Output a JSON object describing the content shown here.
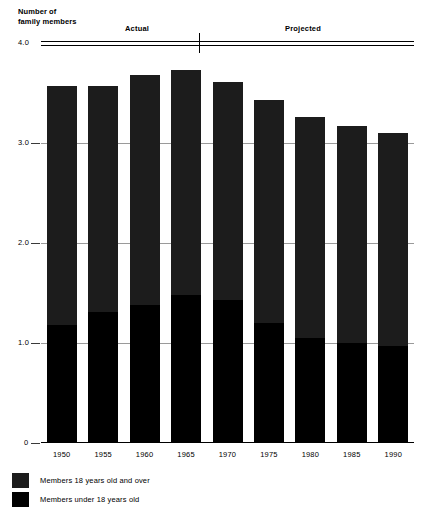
{
  "chart_data": {
    "type": "bar",
    "stacked": true,
    "title": "",
    "ylabel": "Number of\nfamily members",
    "xlabel": "",
    "ylim": [
      0,
      4.0
    ],
    "grid": true,
    "y_ticks": [
      "4.0",
      "3.0",
      "2.0",
      "1.0",
      "0"
    ],
    "y_tick_values": [
      4.0,
      3.0,
      2.0,
      1.0,
      0
    ],
    "categories": [
      "1950",
      "1955",
      "1960",
      "1965",
      "1970",
      "1975",
      "1980",
      "1985",
      "1990"
    ],
    "series": [
      {
        "name": "Members 18 years old and over",
        "values": [
          2.39,
          2.26,
          2.3,
          2.25,
          2.18,
          2.23,
          2.21,
          2.17,
          2.13
        ]
      },
      {
        "name": "Members under 18 years old",
        "values": [
          1.18,
          1.31,
          1.38,
          1.48,
          1.43,
          1.2,
          1.05,
          1.0,
          0.97
        ]
      }
    ],
    "totals": [
      3.57,
      3.57,
      3.68,
      3.73,
      3.61,
      3.43,
      3.26,
      3.17,
      3.1
    ],
    "annotations": [
      {
        "label": "Actual",
        "range": [
          "1950",
          "1970"
        ]
      },
      {
        "label": "Projected",
        "range": [
          "1975",
          "1990"
        ]
      }
    ],
    "colors": {
      "members_over_18": "#1c1c1c",
      "members_under_18": "#000000",
      "gridline": "#9a9a9a",
      "axis": "#000000",
      "background": "#ffffff"
    },
    "legend_position": "bottom-left"
  },
  "axis": {
    "y_title": "Number of\nfamily members"
  },
  "periods": {
    "actual_label": "Actual",
    "projected_label": "Projected"
  },
  "legend": {
    "items": [
      {
        "label": "Members 18 years old and over",
        "color": "#1c1c1c"
      },
      {
        "label": "Members under 18 years old",
        "color": "#000000"
      }
    ]
  }
}
